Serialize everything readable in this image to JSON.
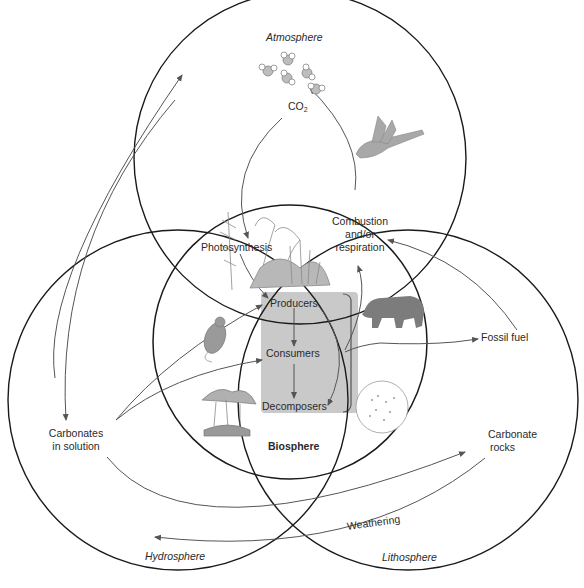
{
  "diagram": {
    "spheres": {
      "atmosphere": "Atmosphere",
      "biosphere": "Biosphere",
      "hydrosphere": "Hydrosphere",
      "lithosphere": "Lithosphere"
    },
    "labels": {
      "co2_main": "CO",
      "co2_sub": "2",
      "photosynthesis": "Photosynthesis",
      "combustion_line1": "Combustion",
      "combustion_line2": "and/or",
      "combustion_line3": "respiration",
      "producers": "Producers",
      "consumers": "Consumers",
      "decomposers": "Decomposers",
      "fossil_fuel": "Fossil fuel",
      "carbonates_line1": "Carbonates",
      "carbonates_line2": "in solution",
      "carbonate_rocks_line1": "Carbonate",
      "carbonate_rocks_line2": "rocks",
      "weathering": "Weathering"
    },
    "illustrations": [
      "co2-molecules",
      "bird",
      "plants",
      "bear",
      "mouse",
      "mushrooms",
      "microbes"
    ],
    "colors": {
      "circle_stroke": "#1a1a1a",
      "arrow_stroke": "#555555",
      "trophic_box": "#c9c9c9",
      "illustration": "#8a8a8a"
    }
  }
}
